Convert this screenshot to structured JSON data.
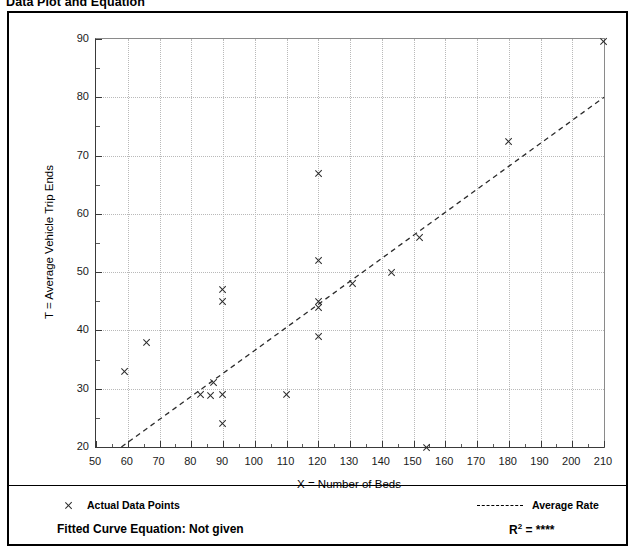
{
  "page_title": "Data Plot and Equation",
  "chart_data": {
    "type": "scatter",
    "title": "Data Plot and Equation",
    "xlabel": "X = Number of Beds",
    "ylabel": "T = Average Vehicle Trip Ends",
    "xlim": [
      50,
      210
    ],
    "ylim": [
      20,
      90
    ],
    "x_major_step": 10,
    "x_minor_step": 5,
    "y_major_step": 10,
    "y_minor_step": 5,
    "grid": true,
    "x_ticks": [
      50,
      60,
      70,
      80,
      90,
      100,
      110,
      120,
      130,
      140,
      150,
      160,
      170,
      180,
      190,
      200,
      210
    ],
    "y_ticks": [
      20,
      30,
      40,
      50,
      60,
      70,
      80,
      90
    ],
    "series": [
      {
        "name": "Actual Data Points",
        "marker": "x",
        "points": [
          [
            59,
            33.0
          ],
          [
            66,
            38.0
          ],
          [
            83,
            29.0
          ],
          [
            86,
            28.8
          ],
          [
            87,
            31.0
          ],
          [
            90,
            29.0
          ],
          [
            90,
            24.0
          ],
          [
            90,
            47.0
          ],
          [
            90,
            45.0
          ],
          [
            110,
            29.0
          ],
          [
            120,
            67.0
          ],
          [
            120,
            52.0
          ],
          [
            120,
            45.0
          ],
          [
            120,
            44.0
          ],
          [
            120,
            39.0
          ],
          [
            131,
            48.0
          ],
          [
            143,
            50.0
          ],
          [
            152,
            56.0
          ],
          [
            154,
            20.0
          ],
          [
            180,
            72.5
          ],
          [
            210,
            89.5
          ]
        ]
      }
    ],
    "trendline": {
      "name": "Average Rate",
      "style": "dashed",
      "x_start": 58,
      "y_start": 20,
      "x_end": 210,
      "y_end": 80
    }
  },
  "legend": {
    "data_points_label": "Actual Data Points",
    "average_rate_label": "Average Rate"
  },
  "footer": {
    "fitted_curve_equation": "Fitted Curve Equation:  Not given",
    "r_squared_symbol": "R",
    "r_squared_exponent": "2",
    "r_squared_value": "= ****"
  },
  "colors": {
    "marker": "#2b2b2b",
    "gridline": "#b9b9b9",
    "axis": "#3a3a3a",
    "frame": "#000000"
  }
}
